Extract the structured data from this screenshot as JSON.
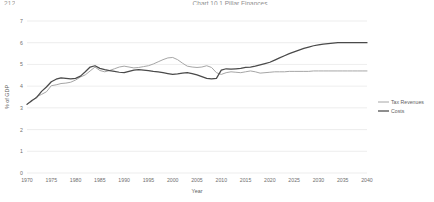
{
  "page": {
    "corner_label": "212",
    "title": "Chart 10.1  Pillar Finances"
  },
  "chart_data": {
    "type": "line",
    "title": "Chart 10.1  Pillar Finances",
    "xlabel": "Year",
    "ylabel": "% of GDP",
    "xlim": [
      1970,
      2040
    ],
    "ylim": [
      0,
      7
    ],
    "ytick_step": 1,
    "xtick_step": 5,
    "grid": true,
    "legend_position": "right",
    "yticks": [
      "0",
      "1",
      "2",
      "3",
      "4",
      "5",
      "6",
      "7"
    ],
    "xticks": [
      "1970",
      "1975",
      "1980",
      "1985",
      "1990",
      "1995",
      "2000",
      "2005",
      "2010",
      "2015",
      "2020",
      "2025",
      "2030",
      "2035",
      "2040"
    ],
    "x": [
      1970,
      1971,
      1972,
      1973,
      1974,
      1975,
      1976,
      1977,
      1978,
      1979,
      1980,
      1981,
      1982,
      1983,
      1984,
      1985,
      1986,
      1987,
      1988,
      1989,
      1990,
      1991,
      1992,
      1993,
      1994,
      1995,
      1996,
      1997,
      1998,
      1999,
      2000,
      2001,
      2002,
      2003,
      2004,
      2005,
      2006,
      2007,
      2008,
      2009,
      2010,
      2011,
      2012,
      2013,
      2014,
      2015,
      2016,
      2017,
      2018,
      2019,
      2020,
      2021,
      2022,
      2023,
      2024,
      2025,
      2026,
      2027,
      2028,
      2029,
      2030,
      2031,
      2032,
      2033,
      2034,
      2035,
      2036,
      2037,
      2038,
      2039,
      2040
    ],
    "series": [
      {
        "name": "Tax Revenues",
        "color": "#a6a6a6",
        "values": [
          3.18,
          3.3,
          3.52,
          3.62,
          3.74,
          4.02,
          4.06,
          4.12,
          4.14,
          4.18,
          4.28,
          4.42,
          4.52,
          4.7,
          4.88,
          4.72,
          4.66,
          4.72,
          4.8,
          4.88,
          4.92,
          4.88,
          4.84,
          4.86,
          4.9,
          4.94,
          5.02,
          5.12,
          5.22,
          5.3,
          5.32,
          5.22,
          5.06,
          4.92,
          4.88,
          4.86,
          4.88,
          4.94,
          4.86,
          4.62,
          4.54,
          4.62,
          4.66,
          4.64,
          4.62,
          4.66,
          4.7,
          4.66,
          4.6,
          4.62,
          4.64,
          4.66,
          4.66,
          4.66,
          4.68,
          4.68,
          4.68,
          4.68,
          4.68,
          4.7,
          4.7,
          4.7,
          4.7,
          4.7,
          4.7,
          4.7,
          4.7,
          4.7,
          4.7,
          4.7,
          4.7
        ]
      },
      {
        "name": "Costs",
        "color": "#4a4a4a",
        "values": [
          3.16,
          3.34,
          3.48,
          3.76,
          3.96,
          4.2,
          4.32,
          4.38,
          4.36,
          4.34,
          4.36,
          4.46,
          4.66,
          4.88,
          4.94,
          4.82,
          4.76,
          4.72,
          4.68,
          4.64,
          4.62,
          4.68,
          4.74,
          4.76,
          4.74,
          4.72,
          4.68,
          4.66,
          4.62,
          4.58,
          4.54,
          4.56,
          4.6,
          4.62,
          4.58,
          4.52,
          4.44,
          4.36,
          4.34,
          4.36,
          4.74,
          4.8,
          4.78,
          4.8,
          4.82,
          4.86,
          4.88,
          4.92,
          4.98,
          5.04,
          5.1,
          5.2,
          5.3,
          5.4,
          5.5,
          5.58,
          5.66,
          5.74,
          5.8,
          5.86,
          5.9,
          5.94,
          5.96,
          5.98,
          6.0,
          6.0,
          6.0,
          6.0,
          6.0,
          6.0,
          6.0
        ]
      }
    ]
  }
}
